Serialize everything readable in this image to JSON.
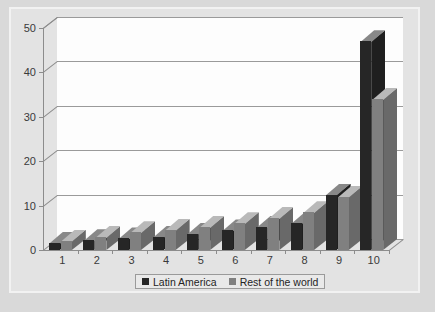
{
  "chart_data": {
    "type": "bar",
    "title": "",
    "subtitle": "",
    "xlabel": "",
    "ylabel": "",
    "categories": [
      "1",
      "2",
      "3",
      "4",
      "5",
      "6",
      "7",
      "8",
      "9",
      "10"
    ],
    "series": [
      {
        "name": "Latin America",
        "color": "#262626",
        "values": [
          1.6,
          2.2,
          2.6,
          2.9,
          3.7,
          4.4,
          5.2,
          6.1,
          12.5,
          47.0
        ]
      },
      {
        "name": "Rest of the world",
        "color": "#808080",
        "values": [
          2.1,
          2.9,
          4.0,
          4.5,
          5.2,
          6.0,
          7.2,
          8.5,
          12.0,
          34.0
        ]
      }
    ],
    "ylim": [
      0,
      50
    ],
    "yticks": [
      "0",
      "10",
      "20",
      "30",
      "40",
      "50"
    ],
    "ytick_values": [
      0,
      10,
      20,
      30,
      40,
      50
    ],
    "grid": true,
    "grid_axis": "y",
    "legend_position": "bottom",
    "style": "3d-clustered-column"
  },
  "legend": {
    "items": [
      {
        "label": "Latin America",
        "color": "#262626"
      },
      {
        "label": "Rest of the world",
        "color": "#808080"
      }
    ]
  },
  "colors": {
    "series_latin_america": "#262626",
    "series_rest_of_world": "#808080",
    "plot_background": "#fdfdfd",
    "panel_background": "#e3e3e3",
    "outer_background": "#d9d9d9",
    "gridline": "#9a9a9a",
    "axis": "#8c8c8c",
    "tick_text": "#3a3a3a"
  }
}
